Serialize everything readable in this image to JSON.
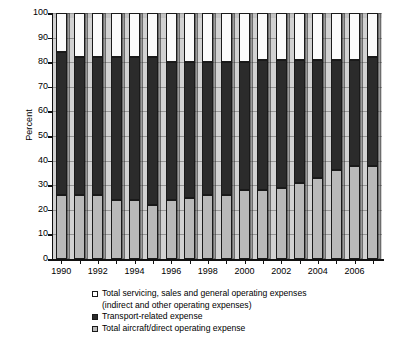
{
  "chart_data": {
    "type": "bar",
    "title": "",
    "subtitle": "",
    "xlabel": "",
    "ylabel": "Percent",
    "ylim": [
      0,
      100
    ],
    "yticks": [
      0,
      10,
      20,
      30,
      40,
      50,
      60,
      70,
      80,
      90,
      100
    ],
    "grid": true,
    "stacked": true,
    "stack_total": 100,
    "legend_position": "bottom",
    "categories": [
      "1990",
      "1991",
      "1992",
      "1993",
      "1994",
      "1995",
      "1996",
      "1997",
      "1998",
      "1999",
      "2000",
      "2001",
      "2002",
      "2003",
      "2004",
      "2005",
      "2006",
      "2007"
    ],
    "xtick_labels": [
      "1990",
      "1992",
      "1994",
      "1996",
      "1998",
      "2000",
      "2002",
      "2004",
      "2006"
    ],
    "series": [
      {
        "name": "Total aircraft/direct operating expense",
        "color": "#b9b9b9",
        "values": [
          26,
          26,
          26,
          24,
          24,
          22,
          24,
          25,
          26,
          26,
          28,
          28,
          29,
          31,
          33,
          36,
          38,
          38
        ]
      },
      {
        "name": "Transport-related expense",
        "color": "#2b2b2b",
        "values": [
          58,
          56,
          56,
          58,
          58,
          60,
          56,
          55,
          54,
          54,
          52,
          53,
          52,
          50,
          48,
          45,
          43,
          44
        ]
      },
      {
        "name": "Total servicing, sales and general operating expenses (indirect and other operating expenses)",
        "color": "#ffffff",
        "values": [
          16,
          18,
          18,
          18,
          18,
          18,
          20,
          20,
          20,
          20,
          20,
          19,
          19,
          19,
          19,
          19,
          19,
          18
        ]
      }
    ],
    "stack_boundaries_percent": {
      "bottom_top": [
        26,
        26,
        26,
        24,
        24,
        22,
        24,
        25,
        26,
        26,
        28,
        28,
        29,
        31,
        33,
        36,
        38,
        38
      ],
      "mid_top": [
        84,
        82,
        82,
        82,
        82,
        82,
        80,
        80,
        80,
        80,
        80,
        81,
        81,
        81,
        81,
        81,
        81,
        82
      ],
      "top_top": [
        100,
        100,
        100,
        100,
        100,
        100,
        100,
        100,
        100,
        100,
        100,
        100,
        100,
        100,
        100,
        100,
        100,
        100
      ]
    }
  },
  "axis": {
    "y_title": "Percent",
    "y_labels": [
      "100",
      "90",
      "80",
      "70",
      "60",
      "50",
      "40",
      "30",
      "20",
      "10",
      "0"
    ],
    "x_labels": [
      "1990",
      "1992",
      "1994",
      "1996",
      "1998",
      "2000",
      "2002",
      "2004",
      "2006"
    ]
  },
  "legend": {
    "items": [
      {
        "marker": "white-square",
        "label": "Total servicing, sales and general operating expenses",
        "sublabel": "(indirect and other operating expenses)"
      },
      {
        "marker": "black-square",
        "label": "Transport-related expense",
        "sublabel": ""
      },
      {
        "marker": "gray-square",
        "label": "Total aircraft/direct operating expense",
        "sublabel": ""
      }
    ]
  }
}
